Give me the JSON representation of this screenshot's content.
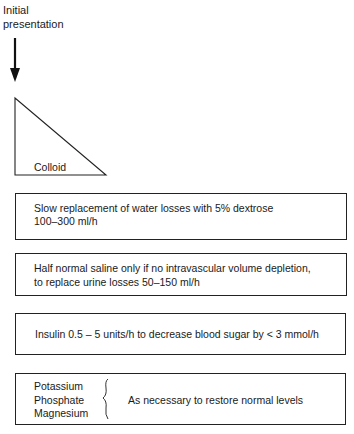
{
  "start": {
    "line1": "Initial",
    "line2": "presentation"
  },
  "triangle": {
    "label": "Colloid"
  },
  "steps": [
    {
      "line1": "Slow replacement of water losses with 5%  dextrose",
      "line2": "100–300 ml/h"
    },
    {
      "line1": "Half normal saline only if no intravascular volume depletion,",
      "line2": "to replace urine losses 50–150 ml/h"
    },
    {
      "line1": "Insulin  0.5 – 5 units/h to decrease blood sugar by <  3 mmol/h"
    },
    {
      "electrolytes": [
        "Potassium",
        "Phosphate",
        "Magnesium"
      ],
      "note": "As necessary to restore normal levels"
    }
  ],
  "colors": {
    "line": "#222222",
    "text": "#1a1a1a",
    "background": "#ffffff"
  }
}
